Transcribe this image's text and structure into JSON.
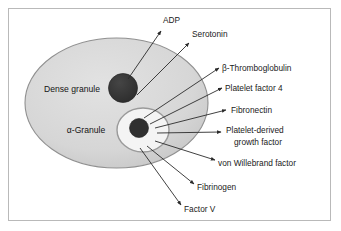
{
  "figure": {
    "background_color": "#ffffff",
    "border_color": "#b9b9b9"
  },
  "cell": {
    "name": "platelet-body",
    "fill_color": "#d8d8d8",
    "stroke_color": "#8f8f8f"
  },
  "granules": [
    {
      "id": "dense-granule",
      "label": "Dense granule",
      "fill_color": "#333333",
      "label_x": 72,
      "label_y": 90
    },
    {
      "id": "alpha-granule",
      "label": "α-Granule",
      "fill_color": "#f2f2f2",
      "core_color": "#2e2e2e",
      "label_x": 86,
      "label_y": 131
    }
  ],
  "secretions": [
    {
      "id": "adp",
      "label": "ADP",
      "source": "dense-granule",
      "text_x": 163,
      "text_y": 21,
      "text_anchor": "start",
      "arrow_x1": 128,
      "arrow_y1": 79,
      "arrow_x2": 161,
      "arrow_y2": 31
    },
    {
      "id": "serotonin",
      "label": "Serotonin",
      "source": "dense-granule",
      "text_x": 192,
      "text_y": 35,
      "text_anchor": "start",
      "arrow_x1": 137,
      "arrow_y1": 95,
      "arrow_x2": 189,
      "arrow_y2": 43
    },
    {
      "id": "beta-thromboglobulin",
      "label": "β-Thromboglobulin",
      "source": "alpha-granule",
      "text_x": 222,
      "text_y": 69,
      "text_anchor": "start",
      "arrow_x1": 144,
      "arrow_y1": 118,
      "arrow_x2": 219,
      "arrow_y2": 68
    },
    {
      "id": "platelet-factor-4",
      "label": "Platelet factor 4",
      "source": "alpha-granule",
      "text_x": 225,
      "text_y": 89,
      "text_anchor": "start",
      "arrow_x1": 150,
      "arrow_y1": 124,
      "arrow_x2": 222,
      "arrow_y2": 88
    },
    {
      "id": "fibronectin",
      "label": "Fibronectin",
      "source": "alpha-granule",
      "text_x": 231,
      "text_y": 111,
      "text_anchor": "start",
      "arrow_x1": 155,
      "arrow_y1": 128,
      "arrow_x2": 226,
      "arrow_y2": 110
    },
    {
      "id": "platelet-derived-growth-factor",
      "label": "Platelet-derived",
      "label_line2": "growth factor",
      "source": "alpha-granule",
      "text_x": 226,
      "text_y": 131,
      "text_anchor": "start",
      "arrow_x1": 157,
      "arrow_y1": 133,
      "arrow_x2": 221,
      "arrow_y2": 132
    },
    {
      "id": "von-willebrand-factor",
      "label": "von Willebrand factor",
      "source": "alpha-granule",
      "text_x": 218,
      "text_y": 164,
      "text_anchor": "start",
      "arrow_x1": 155,
      "arrow_y1": 141,
      "arrow_x2": 215,
      "arrow_y2": 160
    },
    {
      "id": "fibrinogen",
      "label": "Fibrinogen",
      "source": "alpha-granule",
      "text_x": 197,
      "text_y": 188,
      "text_anchor": "start",
      "arrow_x1": 147,
      "arrow_y1": 146,
      "arrow_x2": 194,
      "arrow_y2": 184
    },
    {
      "id": "factor-v",
      "label": "Factor V",
      "source": "alpha-granule",
      "text_x": 184,
      "text_y": 210,
      "text_anchor": "start",
      "arrow_x1": 140,
      "arrow_y1": 148,
      "arrow_x2": 181,
      "arrow_y2": 205
    }
  ]
}
